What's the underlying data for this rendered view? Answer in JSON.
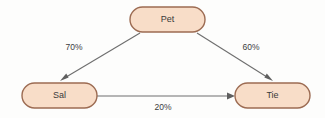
{
  "diagram": {
    "background_color": "#fdfdfc",
    "node_fill_color": "#f8ddc8",
    "node_border_color": "#9c6b52",
    "edge_color": "#6e6e6e",
    "label_color": "#3c3c3c",
    "nodes": [
      {
        "id": "pet",
        "label": "Pet"
      },
      {
        "id": "sal",
        "label": "Sal"
      },
      {
        "id": "tie",
        "label": "Tie"
      }
    ],
    "edges": [
      {
        "id": "pet-sal",
        "from": "Pet",
        "to": "Sal",
        "label": "70%"
      },
      {
        "id": "pet-tie",
        "from": "Pet",
        "to": "Tie",
        "label": "60%"
      },
      {
        "id": "sal-tie",
        "from": "Sal",
        "to": "Tie",
        "label": "20%"
      }
    ]
  }
}
